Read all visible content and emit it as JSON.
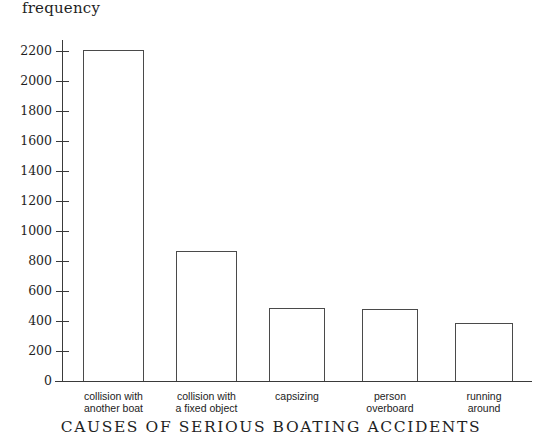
{
  "chart_data": {
    "type": "bar",
    "title": "",
    "xlabel": "CAUSES OF SERIOUS BOATING ACCIDENTS",
    "ylabel": "frequency",
    "categories": [
      "collision with\nanother boat",
      "collision with\na fixed object",
      "capsizing",
      "person\noverboard",
      "running\naround"
    ],
    "category_lines": [
      [
        "collision with",
        "another boat"
      ],
      [
        "collision with",
        "a fixed object"
      ],
      [
        "capsizing",
        ""
      ],
      [
        "person",
        "overboard"
      ],
      [
        "running",
        "around"
      ]
    ],
    "values": [
      2210,
      870,
      490,
      480,
      385
    ],
    "ylim": [
      0,
      2200
    ],
    "ytick_step": 200,
    "yticks": [
      0,
      200,
      400,
      600,
      800,
      1000,
      1200,
      1400,
      1600,
      1800,
      2000,
      2200
    ],
    "ytick_labels": [
      "0",
      "200",
      "400",
      "600",
      "800",
      "1000",
      "1200",
      "1400",
      "1600",
      "1800",
      "2000",
      "2200"
    ],
    "grid": false,
    "legend": null,
    "bar_fill": "#ffffff",
    "bar_edge": "#4a4a4a",
    "axis_color": "#3a3a3a"
  },
  "figure": {
    "top_clipped_text": "frequency"
  }
}
